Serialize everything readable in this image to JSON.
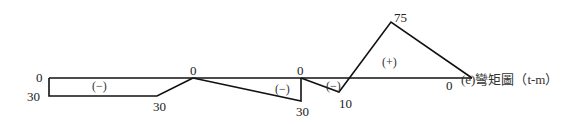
{
  "caption": "(e)彎矩圖（t-m）",
  "labels": {
    "left_top": "0",
    "left_bottom": "30",
    "seg1_end": "30",
    "zero_mid1": "0",
    "zero_mid2": "0",
    "seg2_end": "30",
    "seg3_end": "10",
    "peak": "75",
    "right_zero": "0"
  },
  "signs": {
    "seg1": "(−)",
    "seg2": "(−)",
    "seg3": "(−)",
    "seg4": "(+)"
  },
  "colors": {
    "line": "#111111",
    "text": "#222222"
  }
}
